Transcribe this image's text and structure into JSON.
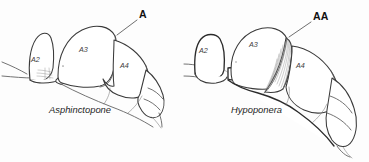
{
  "figure": {
    "type": "scientific-line-drawing",
    "background_color": "#fdfdfd",
    "ink_color": "#3a3a3a",
    "panels": [
      {
        "id": "left",
        "taxon_label": "Asphinctopone",
        "callout": {
          "label": "A",
          "meaning": "no constriction between A3 and A4"
        },
        "segment_labels": [
          {
            "text": "A2",
            "meaning": "petiole"
          },
          {
            "text": "A3",
            "meaning": "first gastral segment"
          },
          {
            "text": "A4",
            "meaning": "second gastral segment"
          }
        ]
      },
      {
        "id": "right",
        "taxon_label": "Hypoponera",
        "callout": {
          "label": "AA",
          "meaning": "strong constriction between A3 and A4"
        },
        "segment_labels": [
          {
            "text": "A2",
            "meaning": "petiole"
          },
          {
            "text": "A3",
            "meaning": "first gastral segment"
          },
          {
            "text": "A4",
            "meaning": "second gastral segment"
          }
        ]
      }
    ]
  }
}
